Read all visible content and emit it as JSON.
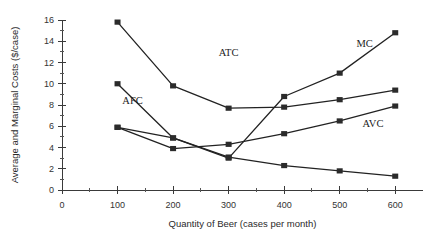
{
  "chart_data": {
    "type": "line",
    "title": "",
    "xlabel": "Quantity of Beer (cases per month)",
    "ylabel": "Average and Marginal Costs ($/case)",
    "x": [
      100,
      200,
      300,
      400,
      500,
      600
    ],
    "xlim": [
      0,
      650
    ],
    "ylim": [
      0,
      16
    ],
    "xticks": [
      0,
      100,
      200,
      300,
      400,
      500,
      600
    ],
    "xtick_labels": [
      "0",
      "100",
      "200",
      "300",
      "400",
      "500",
      "600"
    ],
    "yticks": [
      0,
      2,
      4,
      6,
      8,
      10,
      12,
      14,
      16
    ],
    "ytick_labels": [
      "0",
      "2",
      "4",
      "6",
      "8",
      "10",
      "12",
      "14",
      "16"
    ],
    "yticks_minor": [
      1,
      3,
      5,
      7,
      9,
      11,
      13,
      15
    ],
    "xticks_minor": [
      50,
      150,
      250,
      350,
      450,
      550
    ],
    "grid": false,
    "legend": "inline-annotations",
    "series": [
      {
        "name": "ATC",
        "label": "ATC",
        "label_x": 300,
        "label_y": 12.6,
        "values": [
          15.8,
          9.8,
          7.7,
          7.8,
          8.5,
          9.4
        ]
      },
      {
        "name": "AFC",
        "label": "AFC",
        "label_x": 127,
        "label_y": 8.1,
        "values": [
          10.0,
          4.9,
          3.1,
          2.3,
          1.8,
          1.3
        ]
      },
      {
        "name": "AVC",
        "label": "AVC",
        "label_x": 560,
        "label_y": 5.9,
        "values": [
          5.9,
          3.9,
          4.3,
          5.3,
          6.5,
          7.9
        ]
      },
      {
        "name": "MC",
        "label": "MC",
        "label_x": 545,
        "label_y": 13.5,
        "values": [
          5.9,
          4.9,
          3.0,
          8.8,
          11.0,
          14.8
        ]
      }
    ]
  },
  "geometry": {
    "plot_left": 62,
    "plot_right": 423,
    "plot_top": 20,
    "plot_bottom": 190,
    "x_axis_min": 0,
    "x_axis_max": 650,
    "y_axis_min": 0,
    "y_axis_max": 16
  },
  "colors": {
    "background": "#ffffff",
    "axis": "#3a3a3a",
    "line": "#222222",
    "marker": "#2b2b2b",
    "text": "#1a1a1a"
  }
}
